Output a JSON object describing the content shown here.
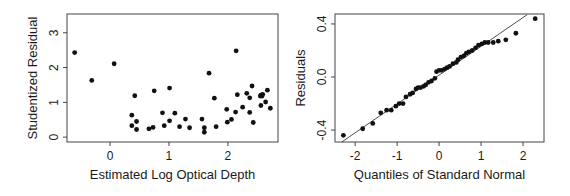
{
  "chart_data": [
    {
      "type": "scatter",
      "title": "",
      "xlabel": "Estimated Log Optical Depth",
      "ylabel": "Studentized Residual",
      "xlim": [
        -0.73,
        2.85
      ],
      "ylim": [
        -0.14,
        3.54
      ],
      "xticks": [
        0,
        1,
        2
      ],
      "yticks": [
        0,
        1,
        2,
        3
      ],
      "grid": false,
      "legend": null,
      "frame": {
        "left": 67,
        "right": 278,
        "top": 14,
        "bottom": 142
      },
      "points": [
        [
          -0.6,
          2.43
        ],
        [
          -0.31,
          1.63
        ],
        [
          0.07,
          2.11
        ],
        [
          0.37,
          0.63
        ],
        [
          0.37,
          0.33
        ],
        [
          0.42,
          1.19
        ],
        [
          0.45,
          0.45
        ],
        [
          0.45,
          0.22
        ],
        [
          0.66,
          0.24
        ],
        [
          0.73,
          0.28
        ],
        [
          0.75,
          1.33
        ],
        [
          0.89,
          0.7
        ],
        [
          0.92,
          0.33
        ],
        [
          1.01,
          1.41
        ],
        [
          1.01,
          0.47
        ],
        [
          1.1,
          0.69
        ],
        [
          1.18,
          0.3
        ],
        [
          1.28,
          0.52
        ],
        [
          1.35,
          0.27
        ],
        [
          1.56,
          0.52
        ],
        [
          1.6,
          0.27
        ],
        [
          1.6,
          0.14
        ],
        [
          1.68,
          1.84
        ],
        [
          1.77,
          1.12
        ],
        [
          1.8,
          0.3
        ],
        [
          1.98,
          0.8
        ],
        [
          1.99,
          0.43
        ],
        [
          2.06,
          0.51
        ],
        [
          2.13,
          0.72
        ],
        [
          2.14,
          2.48
        ],
        [
          2.16,
          1.22
        ],
        [
          2.25,
          0.86
        ],
        [
          2.32,
          1.26
        ],
        [
          2.37,
          1.13
        ],
        [
          2.37,
          0.71
        ],
        [
          2.41,
          1.47
        ],
        [
          2.43,
          0.42
        ],
        [
          2.55,
          1.18
        ],
        [
          2.56,
          1.21
        ],
        [
          2.58,
          1.18
        ],
        [
          2.59,
          1.23
        ],
        [
          2.56,
          0.91
        ],
        [
          2.64,
          1.01
        ],
        [
          2.67,
          1.35
        ],
        [
          2.72,
          0.83
        ]
      ]
    },
    {
      "type": "scatter",
      "title": "",
      "xlabel": "Quantiles of Standard Normal",
      "ylabel": "Residuals",
      "xlim": [
        -2.48,
        2.5
      ],
      "ylim": [
        -0.49,
        0.475
      ],
      "xticks": [
        -2,
        -1,
        0,
        1,
        2
      ],
      "yticks": [
        -0.4,
        0.0,
        0.4
      ],
      "ytick_labels": [
        "-0.4",
        "0.0",
        "0.4"
      ],
      "grid": false,
      "legend": null,
      "frame": {
        "left": 335,
        "right": 544,
        "top": 14,
        "bottom": 142
      },
      "reference_line": {
        "x1": -2.32,
        "y1": -0.49,
        "x2": 2.1,
        "y2": 0.47
      },
      "points": [
        [
          -2.28,
          -0.44
        ],
        [
          -1.82,
          -0.39
        ],
        [
          -1.58,
          -0.35
        ],
        [
          -1.39,
          -0.27
        ],
        [
          -1.25,
          -0.25
        ],
        [
          -1.14,
          -0.25
        ],
        [
          -1.03,
          -0.22
        ],
        [
          -0.95,
          -0.2
        ],
        [
          -0.86,
          -0.2
        ],
        [
          -0.79,
          -0.15
        ],
        [
          -0.69,
          -0.13
        ],
        [
          -0.63,
          -0.12
        ],
        [
          -0.55,
          -0.09
        ],
        [
          -0.5,
          -0.08
        ],
        [
          -0.44,
          -0.08
        ],
        [
          -0.37,
          -0.07
        ],
        [
          -0.32,
          -0.06
        ],
        [
          -0.25,
          -0.04
        ],
        [
          -0.18,
          -0.03
        ],
        [
          -0.1,
          -0.01
        ],
        [
          -0.06,
          0.04
        ],
        [
          0.0,
          0.05
        ],
        [
          0.06,
          0.05
        ],
        [
          0.13,
          0.06
        ],
        [
          0.19,
          0.07
        ],
        [
          0.25,
          0.08
        ],
        [
          0.33,
          0.1
        ],
        [
          0.41,
          0.11
        ],
        [
          0.45,
          0.13
        ],
        [
          0.52,
          0.15
        ],
        [
          0.59,
          0.16
        ],
        [
          0.65,
          0.18
        ],
        [
          0.71,
          0.19
        ],
        [
          0.79,
          0.2
        ],
        [
          0.87,
          0.22
        ],
        [
          0.94,
          0.24
        ],
        [
          1.02,
          0.25
        ],
        [
          1.09,
          0.26
        ],
        [
          1.17,
          0.26
        ],
        [
          1.29,
          0.26
        ],
        [
          1.41,
          0.27
        ],
        [
          1.59,
          0.28
        ],
        [
          1.83,
          0.33
        ],
        [
          2.29,
          0.44
        ]
      ]
    }
  ],
  "labels": {
    "left_xlabel": "Estimated Log Optical Depth",
    "left_ylabel": "Studentized Residual",
    "right_xlabel": "Quantiles of Standard Normal",
    "right_ylabel": "Residuals"
  }
}
